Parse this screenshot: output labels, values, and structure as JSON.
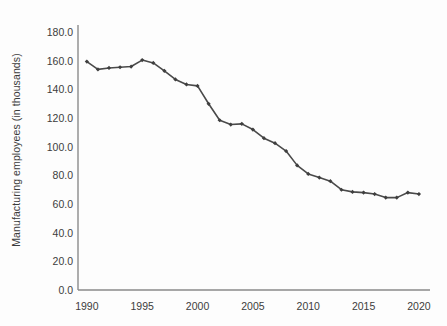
{
  "chart_data": {
    "type": "line",
    "title": "",
    "xlabel": "",
    "ylabel": "Manufacturing employees (in thousands)",
    "xlim": [
      1989.2,
      2021.0
    ],
    "ylim": [
      0.0,
      185.0
    ],
    "grid": false,
    "legend": null,
    "line_color": "#4a4a4a",
    "marker": "diamond",
    "marker_color": "#3f3f3f",
    "axis_color": "#7a7a7a",
    "x_ticks": [
      "1990",
      "1995",
      "2000",
      "2005",
      "2010",
      "2015",
      "2020"
    ],
    "x_tick_values": [
      1990,
      1995,
      2000,
      2005,
      2010,
      2015,
      2020
    ],
    "y_ticks": [
      "0.0",
      "20.0",
      "40.0",
      "60.0",
      "80.0",
      "100.0",
      "120.0",
      "140.0",
      "160.0",
      "180.0"
    ],
    "y_tick_values": [
      0.0,
      20.0,
      40.0,
      60.0,
      80.0,
      100.0,
      120.0,
      140.0,
      160.0,
      180.0
    ],
    "x": [
      1990,
      1991,
      1992,
      1993,
      1994,
      1995,
      1996,
      1997,
      1998,
      1999,
      2000,
      2001,
      2002,
      2003,
      2004,
      2005,
      2006,
      2007,
      2008,
      2009,
      2010,
      2011,
      2012,
      2013,
      2014,
      2015,
      2016,
      2017,
      2018,
      2019,
      2020
    ],
    "values": [
      159.5,
      154.0,
      155.0,
      155.5,
      156.0,
      160.5,
      158.5,
      153.0,
      147.0,
      143.5,
      142.5,
      130.0,
      118.5,
      115.5,
      116.0,
      112.0,
      106.0,
      102.5,
      97.0,
      87.0,
      81.0,
      78.5,
      76.0,
      70.0,
      68.5,
      68.0,
      67.0,
      64.5,
      64.5,
      68.0,
      67.0
    ],
    "series_name": "Manufacturing employees"
  },
  "figure": {
    "background": "#fdfdfd"
  }
}
